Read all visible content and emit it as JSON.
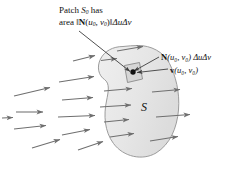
{
  "figure": {
    "name": "flux-through-surface-diagram",
    "width": 235,
    "height": 169,
    "background": "#ffffff"
  },
  "labels": {
    "patch_line1_pre": "Patch ",
    "patch_line1_symbol": "S",
    "patch_line1_sub": "0",
    "patch_line1_post": " has",
    "patch_line2_pre": "area ‖",
    "patch_line2_vector": "N",
    "patch_line2_args_open": "(",
    "patch_line2_u": "u",
    "patch_line2_usub": "0",
    "patch_line2_comma": ", ",
    "patch_line2_v": "v",
    "patch_line2_vsub": "0",
    "patch_line2_args_close": ")",
    "patch_line2_post": "‖",
    "patch_line2_delta": "ΔuΔv",
    "normal_vector": "N",
    "normal_args": "(u₀, v₀)",
    "normal_delta": "ΔuΔv",
    "velocity_vector": "v",
    "velocity_args": "(u₀, v₀)",
    "surface_symbol": "S",
    "full_text_patch": "Patch S0 has area ‖N(u0, v0)‖ΔuΔv",
    "full_text_normal": "N(u0, v0) ΔuΔv",
    "full_text_velocity": "v(u0, v0)",
    "full_text_surface": "S"
  },
  "colors": {
    "surface_fill": "#e7e7e7",
    "surface_stroke": "#9a9a9a",
    "patch_fill": "#d8d8d8",
    "patch_stroke": "#8a8a8a",
    "arrow": "#6f6f6f",
    "leader": "#4a4a4a",
    "text": "#111111",
    "point": "#111111"
  },
  "geometry": {
    "surface_outline": "M 122 47 C 112 47 104 52 100 60 C 96 68 98 76 104 80 C 110 84 108 92 106 102 C 103 116 105 132 114 144 C 124 157 143 161 156 153 C 170 145 177 128 178 110 C 179 92 175 76 169 64 C 163 52 150 46 138 46 C 132 46 127 46 122 47 Z",
    "patch_quad": "M 124 66 L 139 63 L 142 79 L 127 82 Z",
    "point": {
      "x": 132,
      "y": 73,
      "r": 2.6
    },
    "leader_line": {
      "x1": 79,
      "y1": 31,
      "x2": 131,
      "y2": 72
    }
  },
  "vector_field": {
    "description": "gray arrows pointing right, flowing toward and through the surface",
    "arrows_left": [
      {
        "x1": 14,
        "y1": 96,
        "x2": 52,
        "y2": 87
      },
      {
        "x1": 16,
        "y1": 112,
        "x2": 45,
        "y2": 112
      },
      {
        "x1": 14,
        "y1": 129,
        "x2": 48,
        "y2": 125
      },
      {
        "x1": 32,
        "y1": 148,
        "x2": 62,
        "y2": 139
      },
      {
        "x1": 59,
        "y1": 82,
        "x2": 96,
        "y2": 76
      },
      {
        "x1": 62,
        "y1": 100,
        "x2": 95,
        "y2": 97
      },
      {
        "x1": 58,
        "y1": 117,
        "x2": 97,
        "y2": 115
      },
      {
        "x1": 62,
        "y1": 135,
        "x2": 92,
        "y2": 129
      },
      {
        "x1": 78,
        "y1": 150,
        "x2": 105,
        "y2": 141
      },
      {
        "x1": 73,
        "y1": 61,
        "x2": 97,
        "y2": 55
      },
      {
        "x1": 2,
        "y1": 118,
        "x2": 14,
        "y2": 117
      }
    ],
    "arrows_inside": [
      {
        "x1": 100,
        "y1": 60,
        "x2": 118,
        "y2": 58
      },
      {
        "x1": 104,
        "y1": 91,
        "x2": 134,
        "y2": 88
      },
      {
        "x1": 100,
        "y1": 107,
        "x2": 133,
        "y2": 105
      },
      {
        "x1": 104,
        "y1": 122,
        "x2": 131,
        "y2": 119
      },
      {
        "x1": 110,
        "y1": 137,
        "x2": 136,
        "y2": 133
      }
    ],
    "arrows_exiting": [
      {
        "x1": 117,
        "y1": 51,
        "x2": 145,
        "y2": 46
      },
      {
        "x1": 152,
        "y1": 92,
        "x2": 182,
        "y2": 89
      },
      {
        "x1": 156,
        "y1": 117,
        "x2": 192,
        "y2": 114
      },
      {
        "x1": 150,
        "y1": 141,
        "x2": 180,
        "y2": 136
      }
    ]
  }
}
